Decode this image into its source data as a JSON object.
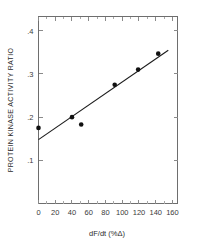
{
  "chart_data": {
    "type": "scatter",
    "title": "",
    "xlabel": "dF/dt (%Δ)",
    "ylabel": "PROTEIN KINASE ACTIVITY RATIO",
    "xlim": [
      0,
      166
    ],
    "ylim": [
      0,
      0.433
    ],
    "grid": false,
    "legend": null,
    "x_ticks": [
      0,
      20,
      40,
      60,
      80,
      100,
      120,
      140,
      160
    ],
    "x_tick_labels": [
      "0",
      "20",
      "40",
      "60",
      "80",
      "100",
      "120",
      "140",
      "160"
    ],
    "x_minor_tick_interval": 10,
    "y_ticks": [
      0.1,
      0.2,
      0.3,
      0.4
    ],
    "y_tick_labels": [
      ".1",
      ".2",
      ".3",
      ".4"
    ],
    "frame": "box",
    "tick_direction": "in",
    "series": [
      {
        "name": "observations",
        "type": "scatter",
        "marker": "filled-circle",
        "color": "#111111",
        "points": [
          {
            "x": 0,
            "y": 0.175
          },
          {
            "x": 40,
            "y": 0.2
          },
          {
            "x": 51,
            "y": 0.183
          },
          {
            "x": 91,
            "y": 0.275
          },
          {
            "x": 119,
            "y": 0.31
          },
          {
            "x": 143,
            "y": 0.347
          }
        ]
      },
      {
        "name": "regression-line",
        "type": "line",
        "color": "#1a1a1a",
        "endpoints": [
          {
            "x": 0,
            "y": 0.148
          },
          {
            "x": 155,
            "y": 0.355
          }
        ]
      }
    ]
  }
}
